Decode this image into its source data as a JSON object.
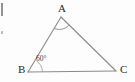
{
  "figure": {
    "name": "triangle-abc-with-60-degree-angle",
    "background_color": "#fdfdfd",
    "stroke_color": "#8a8a8a",
    "label_color": "#2b2b2b",
    "width": 135,
    "height": 82,
    "vertices": [
      {
        "id": "A",
        "label": "A",
        "x": 61,
        "y": 17
      },
      {
        "id": "B",
        "label": "B",
        "x": 28,
        "y": 72
      },
      {
        "id": "C",
        "label": "C",
        "x": 116,
        "y": 71
      }
    ],
    "edges": [
      {
        "id": "AB",
        "from": "A",
        "to": "B"
      },
      {
        "id": "AC",
        "from": "A",
        "to": "C"
      },
      {
        "id": "BC",
        "from": "B",
        "to": "C"
      }
    ],
    "angles": [
      {
        "at": "B",
        "label": "60°",
        "marked": true
      },
      {
        "at": "A",
        "label": "",
        "marked": true
      }
    ],
    "artifacts": [
      {
        "id": "artifact-top",
        "description": "cropped-glyph-fragment"
      },
      {
        "id": "artifact-mid",
        "description": "cropped-mark-fragment"
      }
    ]
  }
}
